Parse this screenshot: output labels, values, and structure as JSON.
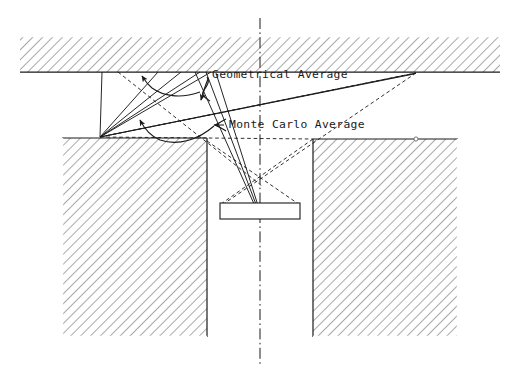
{
  "figure": {
    "background_color": "#ffffff",
    "line_color": "#1a1a1a",
    "hatch_color": "#555555",
    "labels": {
      "geometrical_average": "Geometrical Average",
      "monte_carlo_average": "Monte Carlo Average"
    },
    "annotations": [
      {
        "name": "geometrical-average",
        "text": "Geometrical Average",
        "x": 212,
        "y": 78,
        "leader": "curly-brace-with-arrow"
      },
      {
        "name": "monte-carlo-average",
        "text": "Monte Carlo Average",
        "x": 229,
        "y": 128,
        "leader": "curly-brace-with-arrow"
      }
    ],
    "geometry": {
      "top_slab": {
        "x": 20,
        "y": 36,
        "w": 480,
        "h": 36,
        "hatched": true
      },
      "left_block": {
        "x": 62,
        "y": 138,
        "w": 145,
        "h": 199,
        "hatched": true
      },
      "right_block": {
        "x": 313,
        "y": 139,
        "w": 145,
        "h": 198,
        "hatched": true
      },
      "detector": {
        "x": 220,
        "y": 203,
        "w": 80,
        "h": 16,
        "hatched": false
      },
      "center_line": {
        "x": 260,
        "y1": 18,
        "y2": 366,
        "style": "dash-dot"
      },
      "left_vertex": {
        "x": 100,
        "y": 137
      },
      "right_vertex": {
        "x": 416,
        "y": 73
      },
      "detector_apex": {
        "x": 259,
        "y": 215
      },
      "focus_point": {
        "x": 260,
        "y": 177
      }
    },
    "ray_counts": {
      "solid_rays": 7,
      "dashed_rays": 5
    }
  }
}
